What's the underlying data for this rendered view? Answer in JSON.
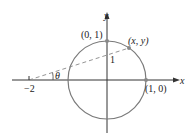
{
  "diagram": {
    "axes": {
      "x_label": "x",
      "y_label": "y"
    },
    "points": {
      "top": "(0, 1)",
      "right": "(1, 0)",
      "moving": "(x, y)",
      "left_tick": "−2"
    },
    "labels": {
      "angle": "θ",
      "intercept": "1"
    },
    "colors": {
      "axis": "#333333",
      "circle": "#7a7a7a",
      "dashed": "#888888",
      "point": "#888888"
    }
  }
}
